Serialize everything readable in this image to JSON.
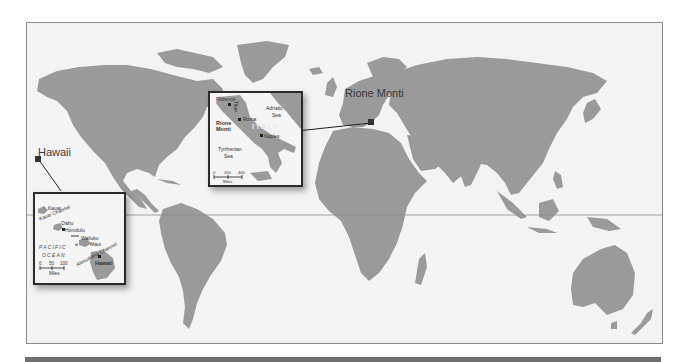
{
  "map": {
    "projection": "world-robinson-style",
    "land_color": "#9a9a9a",
    "water_color": "#f3f3f3",
    "border_color": "#8a8a8a",
    "equator_line": true
  },
  "callouts": [
    {
      "id": "hawaii",
      "label": "Hawaii"
    },
    {
      "id": "rione-monti",
      "label": "Rione Monti"
    }
  ],
  "inset_italy": {
    "places": {
      "florence": "Florence",
      "roma": "Roma",
      "naples": "Naples",
      "rione_monti_line1": "Rione",
      "rione_monti_line2": "Monti"
    },
    "country": "ITALY",
    "seas": {
      "adriatic_line1": "Adriatic",
      "adriatic_line2": "Sea",
      "tyrrhenian_line1": "Tyrrhenian",
      "tyrrhenian_line2": "Sea"
    },
    "river": "Tiber",
    "scale": {
      "ticks": [
        "0",
        "200",
        "400"
      ],
      "unit": "Miles"
    }
  },
  "inset_hawaii": {
    "islands": {
      "kauai": "Kauai",
      "oahu": "Oahu",
      "maui": "Maui",
      "hawaii": "Hawaii"
    },
    "places": {
      "honolulu": "Honolulu",
      "wailuku": "Wailuku"
    },
    "channels": {
      "kauai": "Kauai Channel",
      "alenuihaha": "Alenuihaha Channel"
    },
    "ocean_line1": "PACIFIC",
    "ocean_line2": "OCEAN",
    "scale": {
      "ticks": [
        "0",
        "50",
        "100"
      ],
      "unit": "Miles"
    }
  }
}
